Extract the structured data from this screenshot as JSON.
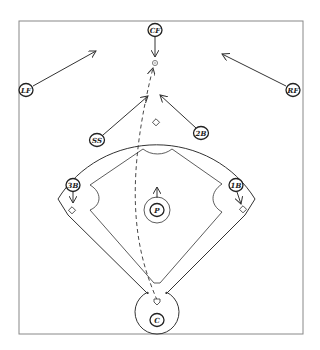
{
  "diagram": {
    "colors": {
      "line": "#333333",
      "frame": "#888888",
      "background": "#ffffff"
    },
    "players": [
      {
        "id": "cf",
        "label": "CF",
        "x": 155,
        "y": 30,
        "arrow_to": [
          155,
          57
        ]
      },
      {
        "id": "lf",
        "label": "LF",
        "x": 26,
        "y": 90,
        "arrow_to": [
          96,
          51
        ]
      },
      {
        "id": "rf",
        "label": "RF",
        "x": 293,
        "y": 90,
        "arrow_to": [
          222,
          54
        ]
      },
      {
        "id": "ss",
        "label": "SS",
        "x": 97,
        "y": 140,
        "arrow_to": [
          148,
          96
        ]
      },
      {
        "id": "2b",
        "label": "2B",
        "x": 201,
        "y": 133,
        "arrow_to": [
          160,
          95
        ]
      },
      {
        "id": "3b",
        "label": "3B",
        "x": 73,
        "y": 185,
        "arrow_to": [
          73,
          203
        ]
      },
      {
        "id": "1b",
        "label": "1B",
        "x": 236,
        "y": 185,
        "arrow_to": [
          241,
          204
        ]
      },
      {
        "id": "p",
        "label": "P",
        "x": 157,
        "y": 210,
        "arrow_to": [
          157,
          187
        ]
      },
      {
        "id": "c",
        "label": "C",
        "x": 157,
        "y": 320,
        "arrow_to": null
      }
    ],
    "ball": {
      "x": 155,
      "y": 63
    },
    "bases": {
      "second": {
        "x": 156,
        "y": 123
      },
      "third": {
        "x": 72,
        "y": 211
      },
      "first": {
        "x": 243,
        "y": 210
      },
      "home": {
        "x": 157,
        "y": 302
      }
    },
    "ball_path": "dashed"
  }
}
